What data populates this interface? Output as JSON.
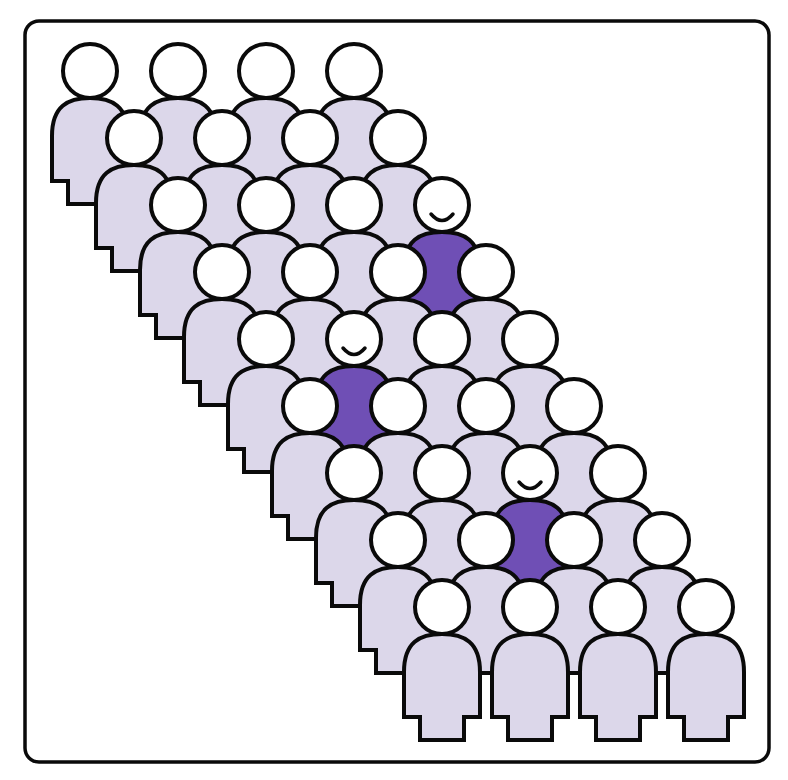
{
  "illustration": {
    "description": "Crowd of person icons arranged in a diagonal band; three figures highlighted in purple with smiling faces",
    "rows": 9,
    "cols": 4,
    "origin": {
      "x": 90,
      "y": 71
    },
    "col_spacing": 88,
    "row_dx": 44,
    "row_dy": 67,
    "head_radius": 27,
    "highlighted": [
      {
        "row": 2,
        "col": 3
      },
      {
        "row": 4,
        "col": 1
      },
      {
        "row": 6,
        "col": 2
      }
    ],
    "colors": {
      "background": "#ffffff",
      "outline": "#0a0a0a",
      "body_fill": "#dcd7ea",
      "head_fill": "#ffffff",
      "highlight_fill": "#6f4fb5"
    },
    "icons": {
      "person": "person-icon",
      "highlighted_person": "smiling-person-icon"
    }
  }
}
